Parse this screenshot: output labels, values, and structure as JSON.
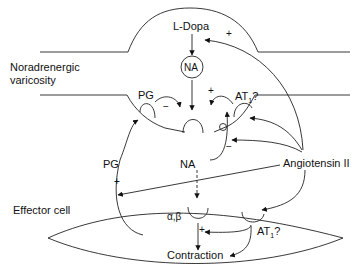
{
  "diagram": {
    "labels": {
      "l_dopa": "L-Dopa",
      "na_vesicle": "NA",
      "noradrenergic_line1": "Noradrenergic",
      "noradrenergic_line2": "varicosity",
      "pg_prejunctional": "PG",
      "at1_prejunctional": "AT",
      "at1_prejunctional_sub": "1",
      "at1_prejunctional_q": "?",
      "na_released": "NA",
      "pg_effector": "PG",
      "angiotensin": "Angiotensin II",
      "effector_cell": "Effector cell",
      "alpha_beta": "α,β",
      "at1_postjunctional": "AT",
      "at1_postjunctional_sub": "1",
      "at1_postjunctional_q": "?",
      "contraction": "Contraction"
    },
    "signs": {
      "ang_to_synthesis": "+",
      "pg_inhibit": "−",
      "at1_facilitate": "+",
      "ang_inhibit_uptake": "−",
      "ang_to_pg": "+",
      "at1_to_contraction": "+"
    }
  }
}
